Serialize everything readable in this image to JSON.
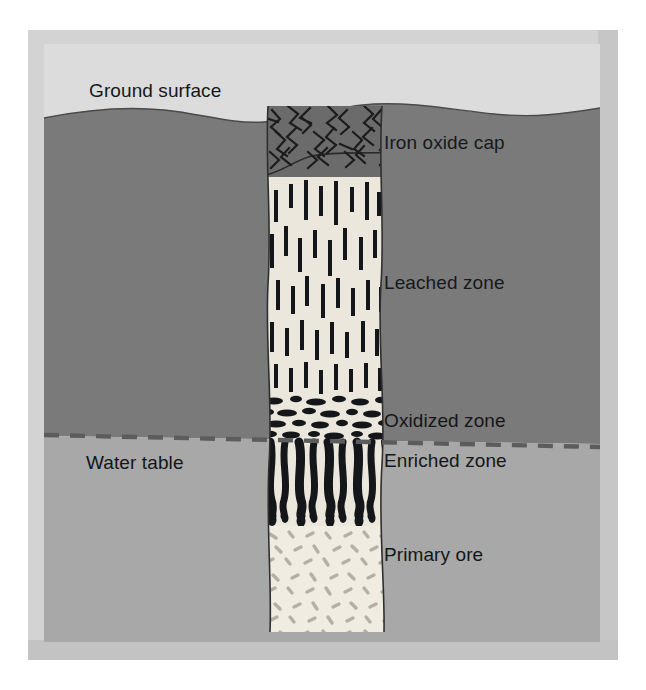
{
  "figure": {
    "type": "geological-cross-section",
    "labels": {
      "ground_surface": "Ground surface",
      "iron_oxide_cap": "Iron oxide cap",
      "leached_zone": "Leached zone",
      "oxidized_zone": "Oxidized zone",
      "enriched_zone": "Enriched zone",
      "primary_ore": "Primary ore",
      "water_table": "Water table"
    }
  },
  "zones": [
    {
      "id": "iron-oxide-cap",
      "label": "Iron oxide cap",
      "order": 1,
      "fill": "#6b6b6b",
      "pattern": "angular-zigzag-lines",
      "top": 68,
      "bottom": 128
    },
    {
      "id": "leached-zone",
      "label": "Leached zone",
      "order": 2,
      "fill": "#ebe7dd",
      "pattern": "vertical-dashes",
      "top": 128,
      "bottom": 350
    },
    {
      "id": "oxidized-zone",
      "label": "Oxidized zone",
      "order": 3,
      "fill": "#ebe7dd",
      "pattern": "horizontal-ellipse-blobs",
      "top": 350,
      "bottom": 396
    },
    {
      "id": "enriched-zone",
      "label": "Enriched zone",
      "order": 4,
      "fill": "#ebe7dd",
      "pattern": "thick-wavy-vertical-bars",
      "top": 396,
      "bottom": 472
    },
    {
      "id": "primary-ore",
      "label": "Primary ore",
      "order": 5,
      "fill": "#f0ece2",
      "pattern": "scattered-speckles",
      "top": 472,
      "bottom": 588
    }
  ],
  "ground": {
    "upper_fill": "#7a7a7a",
    "lower_fill": "#a8a8a8",
    "sky_fill": "#dcdcdc",
    "surface_style": "wavy-curve"
  },
  "water_table": {
    "label": "Water table",
    "style": "dashed",
    "color": "#5c5c5c",
    "y_left": 392,
    "y_right": 404
  },
  "frame": {
    "mat_color": "#d3d3d3",
    "bevel_color": "#c3c3c3",
    "page_color": "#ffffff"
  }
}
